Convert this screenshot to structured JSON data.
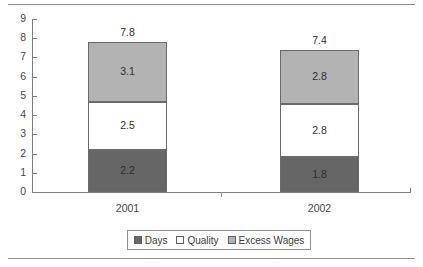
{
  "chart_data": {
    "type": "bar",
    "stacked": true,
    "title": "",
    "xlabel": "",
    "ylabel": "",
    "categories": [
      "2001",
      "2002"
    ],
    "ylim": [
      0,
      9
    ],
    "yticks": [
      0,
      1,
      2,
      3,
      4,
      5,
      6,
      7,
      8,
      9
    ],
    "ytick_labels": [
      "0",
      "1",
      "2",
      "3",
      "4",
      "5",
      "6",
      "7",
      "8",
      "9"
    ],
    "grid": false,
    "legend_position": "bottom",
    "series": [
      {
        "name": "Days",
        "values": [
          2.2,
          1.8
        ],
        "labels": [
          "2.2",
          "1.8"
        ],
        "color": "#666666"
      },
      {
        "name": "Quality",
        "values": [
          2.5,
          2.8
        ],
        "labels": [
          "2.5",
          "2.8"
        ],
        "color": "#ffffff"
      },
      {
        "name": "Excess Wages",
        "values": [
          3.1,
          2.8
        ],
        "labels": [
          "3.1",
          "2.8"
        ],
        "color": "#b3b3b3"
      }
    ],
    "totals": [
      7.8,
      7.4
    ],
    "total_labels": [
      "7.8",
      "7.4"
    ]
  },
  "legend": {
    "items": [
      {
        "label": "Days"
      },
      {
        "label": "Quality"
      },
      {
        "label": "Excess Wages"
      }
    ]
  }
}
